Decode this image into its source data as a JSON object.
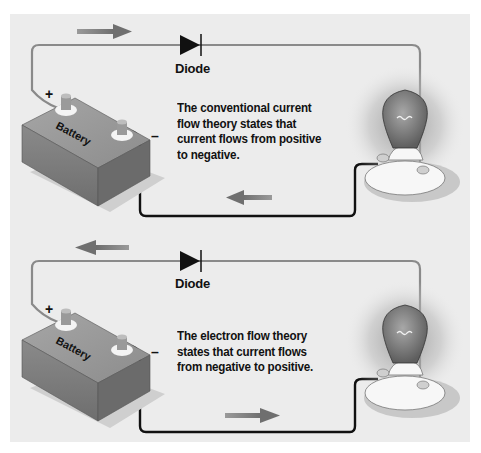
{
  "diagrams": [
    {
      "id": "conventional",
      "title": "Conventional current flow",
      "diode_label": "Diode",
      "battery_label": "Battery",
      "positive_sign": "+",
      "negative_sign": "–",
      "description": "The conventional current flow theory states that current flows from positive to negative.",
      "top_arrow_direction": "right",
      "bottom_arrow_direction": "left"
    },
    {
      "id": "electron",
      "title": "Electron flow",
      "diode_label": "Diode",
      "battery_label": "Battery",
      "positive_sign": "+",
      "negative_sign": "–",
      "description": "The electron flow theory states that current flows from negative to positive.",
      "top_arrow_direction": "left",
      "bottom_arrow_direction": "right"
    }
  ],
  "colors": {
    "background": "#ececec",
    "wire_positive": "#8a8a8a",
    "wire_negative": "#111111",
    "arrow": "#7a7a7a",
    "battery_top": "#9a9a9a",
    "battery_front": "#7d7d7d",
    "battery_side": "#6a6a6a",
    "text": "#111111"
  }
}
